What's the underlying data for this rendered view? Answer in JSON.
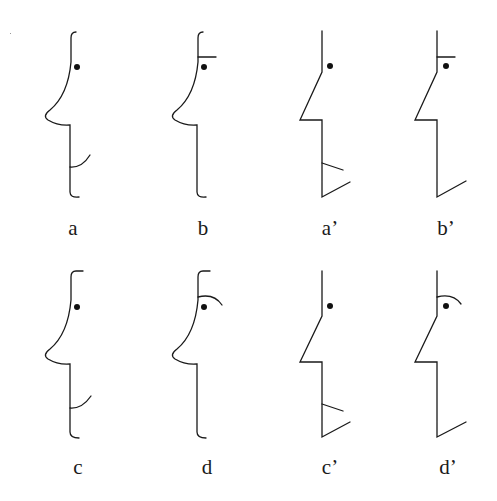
{
  "figure": {
    "stroke_color": "#1a1a1a",
    "background": "#ffffff",
    "panels": [
      {
        "id": "a",
        "label": "a",
        "style": "curved",
        "features": [
          "eye",
          "smile"
        ]
      },
      {
        "id": "b",
        "label": "b",
        "style": "curved",
        "features": [
          "eye",
          "flat-brow"
        ]
      },
      {
        "id": "a2",
        "label": "a’",
        "style": "angular",
        "features": [
          "eye",
          "angular-smile"
        ]
      },
      {
        "id": "b2",
        "label": "b’",
        "style": "angular",
        "features": [
          "eye",
          "flat-brow"
        ]
      },
      {
        "id": "c",
        "label": "c",
        "style": "curved",
        "features": [
          "eye",
          "smile"
        ]
      },
      {
        "id": "d",
        "label": "d",
        "style": "curved",
        "features": [
          "eye",
          "arched-brow"
        ]
      },
      {
        "id": "c2",
        "label": "c’",
        "style": "angular",
        "features": [
          "eye",
          "angular-smile"
        ]
      },
      {
        "id": "d2",
        "label": "d’",
        "style": "angular",
        "features": [
          "eye",
          "arched-brow"
        ]
      }
    ]
  }
}
